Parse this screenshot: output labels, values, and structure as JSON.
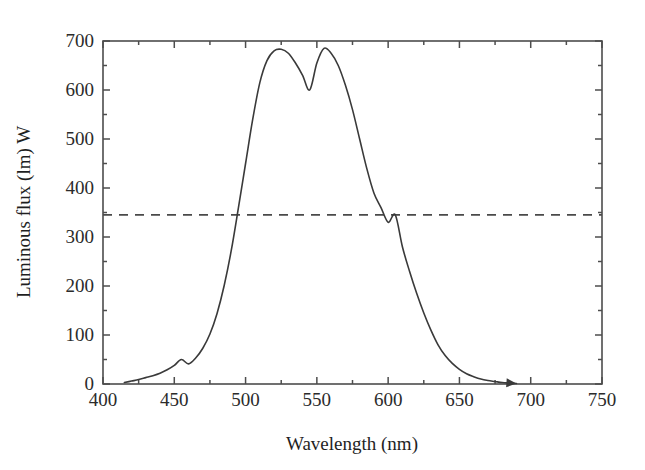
{
  "chart_data": {
    "type": "line",
    "title": "",
    "xlabel": "Wavelength (nm)",
    "ylabel": "Luminous flux (lm) W",
    "xlim": [
      400,
      750
    ],
    "ylim": [
      0,
      700
    ],
    "grid": false,
    "legend_position": "none",
    "xticks": [
      400,
      450,
      500,
      550,
      600,
      650,
      700,
      750
    ],
    "xtick_labels": [
      "400",
      "450",
      "500",
      "550",
      "600",
      "650",
      "700",
      "750"
    ],
    "xminor_ticks": [
      425,
      475,
      525,
      575,
      625,
      675,
      725
    ],
    "yticks": [
      0,
      100,
      200,
      300,
      400,
      500,
      600,
      700
    ],
    "ytick_labels": [
      "0",
      "100",
      "200",
      "300",
      "400",
      "500",
      "600",
      "700"
    ],
    "yminor_ticks": [
      50,
      150,
      250,
      350,
      450,
      550,
      650
    ],
    "series": [
      {
        "name": "Photopic luminous efficacy",
        "style": "solid",
        "color": "#3a3a3a",
        "end_marker": "arrow",
        "x": [
          415,
          420,
          425,
          430,
          435,
          440,
          445,
          450,
          455,
          460,
          465,
          470,
          475,
          480,
          485,
          490,
          495,
          500,
          505,
          510,
          515,
          520,
          525,
          530,
          535,
          540,
          545,
          550,
          555,
          560,
          565,
          570,
          575,
          580,
          585,
          590,
          595,
          600,
          605,
          610,
          615,
          620,
          625,
          630,
          635,
          640,
          645,
          650,
          655,
          660,
          665,
          670,
          675,
          680,
          685,
          690
        ],
        "y": [
          3,
          6,
          9,
          13,
          17,
          22,
          29,
          38,
          50,
          41,
          53,
          73,
          102,
          144,
          201,
          273,
          360,
          450,
          540,
          615,
          660,
          680,
          683,
          675,
          655,
          630,
          600,
          655,
          685,
          675,
          650,
          610,
          560,
          500,
          440,
          390,
          360,
          330,
          345,
          280,
          230,
          185,
          145,
          110,
          80,
          58,
          42,
          30,
          21,
          15,
          10,
          7,
          5,
          3,
          2,
          1
        ],
        "y_note": "Luminous efficacy in lm/W; smooth bell peaking near 685 at 555 nm"
      },
      {
        "name": "Reference level",
        "style": "dashed",
        "color": "#4a4a4a",
        "type": "horizontal_line",
        "value": 345,
        "crossings": [
          504,
          605
        ]
      }
    ],
    "annotations": [
      {
        "text": "peak",
        "x": 555,
        "y": 685
      },
      {
        "text": "curve start",
        "x": 415,
        "y": 0
      },
      {
        "text": "arrowhead end",
        "x": 690,
        "y": 2
      }
    ]
  },
  "axes": {
    "x_title": "Wavelength (nm)",
    "y_title": "Luminous flux (lm) W"
  },
  "colors": {
    "frame": "#4d4d4d",
    "curve": "#3a3a3a",
    "dashed": "#4a4a4a",
    "text": "#1f1f1f",
    "background": "#ffffff"
  }
}
